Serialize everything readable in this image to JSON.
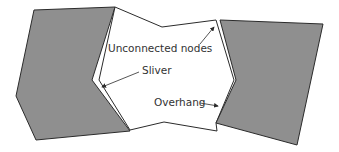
{
  "diagram": {
    "labels": {
      "unconnected_nodes": "Unconnected nodes",
      "sliver": "Sliver",
      "overhang": "Overhang"
    },
    "colors": {
      "gray_fill": "#8f8f8f",
      "stroke": "#2b2b2b",
      "white_fill": "#ffffff",
      "text": "#333333"
    }
  }
}
